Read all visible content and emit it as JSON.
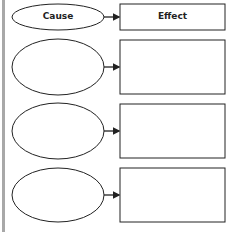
{
  "diagram": {
    "header": {
      "cause_label": "Cause",
      "effect_label": "Effect"
    },
    "rows": [
      {
        "cause": "",
        "effect": ""
      },
      {
        "cause": "",
        "effect": ""
      },
      {
        "cause": "",
        "effect": ""
      }
    ],
    "colors": {
      "stroke": "#222222",
      "background": "#ffffff",
      "left_border": "#a8a8a8"
    }
  }
}
